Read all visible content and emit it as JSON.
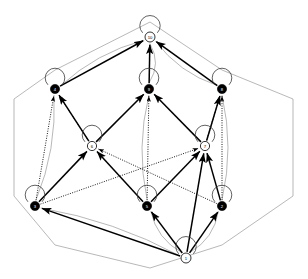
{
  "figure": {
    "kind": "lattice-hasse-diagram",
    "title": "",
    "caption": "",
    "background_color": "#ffffff",
    "width": 308,
    "height": 279
  },
  "palette": {
    "filled_node": "#000000",
    "open_node_fill": "#ffffff",
    "node_stroke": "#000000",
    "solid_edge": "#000000",
    "dotted_edge": "#000000",
    "outline_edge": "#9a9a9a",
    "loop_edge": "#3a3a3a",
    "label_on_dark": "#ffffff",
    "label_on_light": "#000000"
  },
  "legend": {
    "filled_meaning": "closed element",
    "open_meaning": "open element",
    "solid_meaning": "covering relation",
    "dotted_meaning": "secondary relation",
    "outline_meaning": "cube frame"
  },
  "nodes": [
    {
      "id": "top",
      "label": "10",
      "x": 150,
      "y": 37,
      "r": 5.0,
      "style": "open",
      "loop": true,
      "loop_dir": "up",
      "rank": 0
    },
    {
      "id": "a",
      "label": "4",
      "x": 55,
      "y": 89,
      "r": 4.6,
      "style": "filled",
      "loop": true,
      "loop_dir": "up",
      "rank": 1
    },
    {
      "id": "b",
      "label": "9",
      "x": 149,
      "y": 89,
      "r": 4.6,
      "style": "filled",
      "loop": true,
      "loop_dir": "up",
      "rank": 1
    },
    {
      "id": "c",
      "label": "8",
      "x": 222,
      "y": 89,
      "r": 4.6,
      "style": "filled",
      "loop": true,
      "loop_dir": "up",
      "rank": 1
    },
    {
      "id": "d",
      "label": "6",
      "x": 92,
      "y": 146,
      "r": 4.6,
      "style": "open",
      "loop": true,
      "loop_dir": "up",
      "rank": 2
    },
    {
      "id": "e",
      "label": "7",
      "x": 205,
      "y": 146,
      "r": 4.6,
      "style": "open",
      "loop": true,
      "loop_dir": "up",
      "rank": 2
    },
    {
      "id": "f",
      "label": "3",
      "x": 35,
      "y": 206,
      "r": 4.6,
      "style": "filled",
      "loop": true,
      "loop_dir": "up",
      "rank": 3
    },
    {
      "id": "g",
      "label": "5",
      "x": 147,
      "y": 206,
      "r": 4.6,
      "style": "filled",
      "loop": true,
      "loop_dir": "up",
      "rank": 3
    },
    {
      "id": "h",
      "label": "2",
      "x": 222,
      "y": 206,
      "r": 4.6,
      "style": "filled",
      "loop": true,
      "loop_dir": "up",
      "rank": 3
    },
    {
      "id": "bot",
      "label": "1",
      "x": 186,
      "y": 258,
      "r": 5.0,
      "style": "open",
      "loop": true,
      "loop_dir": "up",
      "rank": 4
    }
  ],
  "edges_solid": [
    {
      "from": "a",
      "to": "top",
      "arrow": true
    },
    {
      "from": "b",
      "to": "top",
      "arrow": true
    },
    {
      "from": "c",
      "to": "top",
      "arrow": true
    },
    {
      "from": "d",
      "to": "a",
      "arrow": true
    },
    {
      "from": "d",
      "to": "b",
      "arrow": true
    },
    {
      "from": "e",
      "to": "b",
      "arrow": true
    },
    {
      "from": "e",
      "to": "c",
      "arrow": true
    },
    {
      "from": "f",
      "to": "d",
      "arrow": true
    },
    {
      "from": "g",
      "to": "d",
      "arrow": true
    },
    {
      "from": "g",
      "to": "e",
      "arrow": true
    },
    {
      "from": "h",
      "to": "e",
      "arrow": true
    },
    {
      "from": "bot",
      "to": "f",
      "arrow": true
    },
    {
      "from": "bot",
      "to": "g",
      "arrow": true
    },
    {
      "from": "bot",
      "to": "h",
      "arrow": true
    },
    {
      "from": "bot",
      "to": "e",
      "arrow": true
    }
  ],
  "edges_dotted": [
    {
      "from": "f",
      "to": "a",
      "arrow": true
    },
    {
      "from": "g",
      "to": "b",
      "arrow": true
    },
    {
      "from": "h",
      "to": "c",
      "arrow": true
    },
    {
      "from": "f",
      "to": "e",
      "arrow": true
    },
    {
      "from": "h",
      "to": "d",
      "arrow": true
    },
    {
      "from": "d",
      "to": "a",
      "arrow": true
    },
    {
      "from": "e",
      "to": "c",
      "arrow": true
    }
  ],
  "edges_outline": [
    {
      "from": "top",
      "to": "a"
    },
    {
      "from": "top",
      "to": "b"
    },
    {
      "from": "top",
      "to": "c"
    },
    {
      "from": "a",
      "to": "f"
    },
    {
      "from": "b",
      "to": "g"
    },
    {
      "from": "c",
      "to": "h"
    },
    {
      "from": "bot",
      "to": "f"
    },
    {
      "from": "bot",
      "to": "g"
    },
    {
      "from": "bot",
      "to": "h"
    }
  ],
  "frame_outer": {
    "points": "14,99 55,70 150,22 222,70 293,99 293,196 222,245 150,268 55,245 14,196"
  }
}
